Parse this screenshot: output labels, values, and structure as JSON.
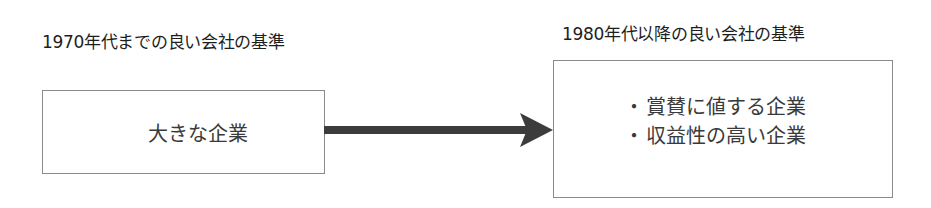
{
  "diagram": {
    "left": {
      "title": "1970年代までの良い会社の基準",
      "box_text": "大きな企業"
    },
    "right": {
      "title": "1980年代以降の良い会社の基準",
      "items": [
        {
          "bullet": "・",
          "text": "賞賛に値する企業"
        },
        {
          "bullet": "・",
          "text": "収益性の高い企業"
        }
      ]
    },
    "arrow": {
      "icon": "arrow-right-icon",
      "direction": "left-to-right",
      "color": "#3c3c3c"
    },
    "colors": {
      "border": "#8a8a8a",
      "title_text": "#1e1e1e",
      "box_text": "#3a3a3a",
      "background": "#ffffff"
    }
  }
}
